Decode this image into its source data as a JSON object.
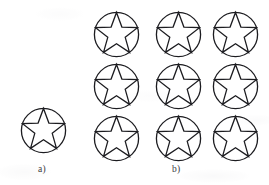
{
  "figure": {
    "canvas": {
      "width": 269,
      "height": 185
    },
    "background_color": "#ffffff",
    "stroke_color": "#1c1c20",
    "stroke_width": 1.3,
    "fill": "none"
  },
  "panels": [
    {
      "id": "a",
      "label": "a)",
      "label_x": 38,
      "label_y": 165,
      "description": "single star-in-circle symbol",
      "count": 1,
      "items": [
        {
          "x": 20,
          "y": 107,
          "size": 47
        }
      ]
    },
    {
      "id": "b",
      "label": "b)",
      "label_x": 172,
      "label_y": 165,
      "description": "three by three grid of star-in-circle symbols",
      "count": 9,
      "rows": 3,
      "columns": 3,
      "items": [
        {
          "x": 93,
          "y": 11,
          "size": 47
        },
        {
          "x": 155,
          "y": 11,
          "size": 47
        },
        {
          "x": 212,
          "y": 11,
          "size": 47
        },
        {
          "x": 93,
          "y": 63,
          "size": 47
        },
        {
          "x": 155,
          "y": 63,
          "size": 47
        },
        {
          "x": 212,
          "y": 63,
          "size": 47
        },
        {
          "x": 93,
          "y": 115,
          "size": 47
        },
        {
          "x": 155,
          "y": 115,
          "size": 47
        },
        {
          "x": 212,
          "y": 115,
          "size": 47
        }
      ]
    }
  ],
  "symbol": {
    "name": "star-in-circle-icon",
    "circle": {
      "cx": 50,
      "cy": 50,
      "r": 47
    },
    "star": {
      "points": 5,
      "outer_radius": 47,
      "inner_radius": 19.5,
      "rotation_deg": -90
    }
  }
}
